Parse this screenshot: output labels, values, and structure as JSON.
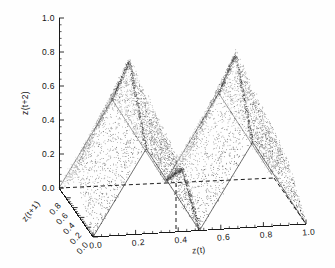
{
  "figure": {
    "background_color": "#fefefe",
    "ink_color": "#1a1a1a",
    "point_color": "#2b2b2b"
  },
  "chart_data": {
    "type": "scatter",
    "projection": "3d",
    "title": "",
    "subtitle": "",
    "xlabel": "z(t)",
    "ylabel": "z(t+1)",
    "zlabel": "z(t+2)",
    "xlim": [
      0.0,
      1.0
    ],
    "ylim": [
      0.0,
      1.0
    ],
    "zlim": [
      0.0,
      1.0
    ],
    "grid": false,
    "legend": null,
    "legend_position": "none",
    "xticks": [
      "0.0",
      "0.2",
      "0.4",
      "0.6",
      "0.8",
      "1.0"
    ],
    "xtick_values": [
      0.0,
      0.2,
      0.4,
      0.6,
      0.8,
      1.0
    ],
    "yticks": [
      "0.0",
      "0.2",
      "0.4",
      "0.6",
      "0.8"
    ],
    "ytick_values": [
      0.0,
      0.2,
      0.4,
      0.6,
      0.8
    ],
    "zticks": [
      "0.0",
      "0.2",
      "0.4",
      "0.6",
      "0.8",
      "1.0"
    ],
    "ztick_values": [
      0.0,
      0.2,
      0.4,
      0.6,
      0.8,
      1.0
    ],
    "minor_ticks_per_interval": 4,
    "annotations": [],
    "surface_peaks_z": [
      0.82,
      0.86,
      0.86,
      0.88
    ],
    "surface_valleys_z": [
      0.0,
      0.0,
      0.0
    ],
    "n_points": 6000,
    "series": [
      {
        "name": "attractor",
        "marker": "dot",
        "marker_size": 0.75,
        "color": "#2b2b2b"
      }
    ]
  }
}
